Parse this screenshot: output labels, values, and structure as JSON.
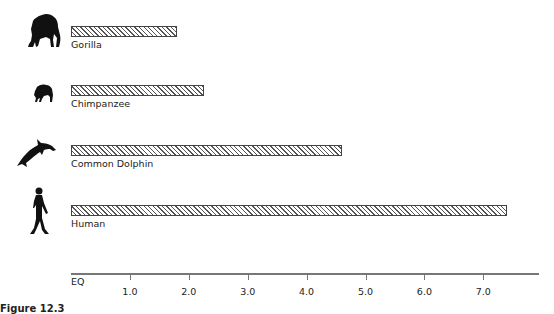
{
  "chart_data": {
    "type": "bar",
    "orientation": "horizontal",
    "title": "",
    "xlabel": "EQ",
    "ylabel": "",
    "xlim": [
      0,
      7.9
    ],
    "grid": false,
    "legend": null,
    "categories": [
      "Gorilla",
      "Chimpanzee",
      "Common Dolphin",
      "Human"
    ],
    "values": [
      1.8,
      2.25,
      4.6,
      7.4
    ],
    "x_ticks": [
      "1.0",
      "2.0",
      "3.0",
      "4.0",
      "5.0",
      "6.0",
      "7.0"
    ],
    "icons": [
      "gorilla-icon",
      "chimpanzee-icon",
      "dolphin-icon",
      "human-icon"
    ],
    "bar_style": "diagonal-hatch"
  },
  "axis": {
    "name": "EQ",
    "ticks": [
      {
        "label": "1.0",
        "value": 1
      },
      {
        "label": "2.0",
        "value": 2
      },
      {
        "label": "3.0",
        "value": 3
      },
      {
        "label": "4.0",
        "value": 4
      },
      {
        "label": "5.0",
        "value": 5
      },
      {
        "label": "6.0",
        "value": 6
      },
      {
        "label": "7.0",
        "value": 7
      }
    ]
  },
  "bars": [
    {
      "label": "Gorilla",
      "value": 1.8
    },
    {
      "label": "Chimpanzee",
      "value": 2.25
    },
    {
      "label": "Common Dolphin",
      "value": 4.6
    },
    {
      "label": "Human",
      "value": 7.4
    }
  ],
  "caption": "Figure 12.3"
}
